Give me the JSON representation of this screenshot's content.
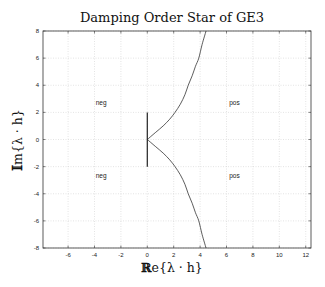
{
  "chart_data": {
    "type": "line",
    "title": "Damping Order Star of GE3",
    "xlabel": "Re{λ · h}",
    "ylabel": "Im{λ · h}",
    "xlim": [
      -7.9,
      12.4
    ],
    "ylim": [
      -8,
      8
    ],
    "xticks": [
      -6,
      -4,
      -2,
      0,
      2,
      4,
      6,
      8,
      10,
      12
    ],
    "yticks": [
      -8,
      -6,
      -4,
      -2,
      0,
      2,
      4,
      6,
      8
    ],
    "grid": true,
    "legend": null,
    "series": [
      {
        "name": "order star boundary (upper)",
        "x": [
          0,
          0.6,
          1.2,
          1.7,
          2.1,
          2.5,
          2.85,
          3.1,
          3.4,
          3.65,
          3.9,
          4.15,
          4.45
        ],
        "y": [
          0,
          0.5,
          1.0,
          1.5,
          2.0,
          2.6,
          3.3,
          4.0,
          4.7,
          5.4,
          6.0,
          7.0,
          8.0
        ]
      },
      {
        "name": "order star boundary (lower)",
        "x": [
          0,
          0.6,
          1.2,
          1.7,
          2.1,
          2.5,
          2.85,
          3.1,
          3.4,
          3.65,
          3.9,
          4.15,
          4.45
        ],
        "y": [
          0,
          -0.5,
          -1.0,
          -1.5,
          -2.0,
          -2.6,
          -3.3,
          -4.0,
          -4.7,
          -5.4,
          -6.0,
          -7.0,
          -8.0
        ]
      },
      {
        "name": "imaginary-axis segment",
        "x": [
          0,
          0
        ],
        "y": [
          -2,
          2
        ]
      }
    ],
    "annotations": [
      {
        "text": "neg",
        "x": -3.5,
        "y": 2.7
      },
      {
        "text": "pos",
        "x": 6.6,
        "y": 2.7
      },
      {
        "text": "neg",
        "x": -3.5,
        "y": -2.7
      },
      {
        "text": "pos",
        "x": 6.6,
        "y": -2.7
      }
    ]
  }
}
